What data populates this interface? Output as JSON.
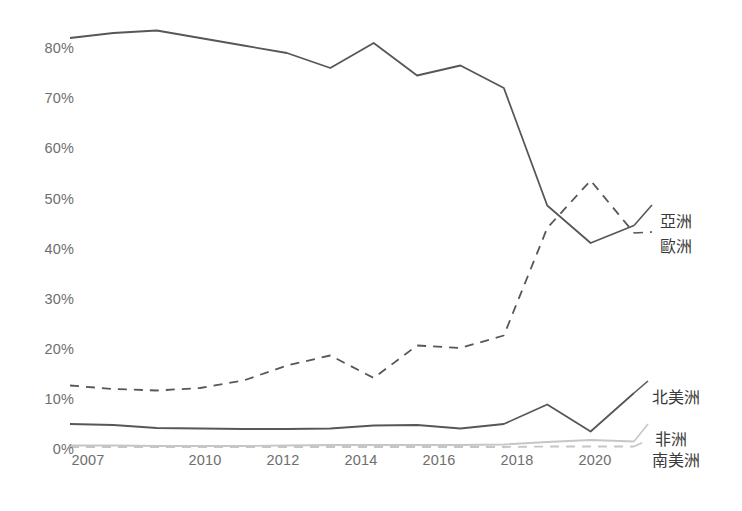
{
  "chart_data": {
    "type": "line",
    "title": "",
    "subtitle": "",
    "xlabel": "",
    "ylabel": "",
    "grid": false,
    "legend_position": "right-inline-end-of-line",
    "x": [
      2007,
      2008,
      2009,
      2010,
      2011,
      2012,
      2013,
      2014,
      2015,
      2016,
      2017,
      2018,
      2019,
      2020
    ],
    "xtick_labels": [
      "2007",
      "2010",
      "2012",
      "2014",
      "2016",
      "2018",
      "2020"
    ],
    "xtick_values": [
      2007,
      2010,
      2012,
      2014,
      2016,
      2018,
      2020
    ],
    "ytick_labels": [
      "0%",
      "10%",
      "20%",
      "30%",
      "40%",
      "50%",
      "60%",
      "70%",
      "80%"
    ],
    "ytick_values": [
      0,
      10,
      20,
      30,
      40,
      50,
      60,
      70,
      80
    ],
    "ylim": [
      0,
      86
    ],
    "xlim": [
      2007,
      2020
    ],
    "yunit": "%",
    "series": [
      {
        "name": "亞洲",
        "label": "亞洲",
        "style": "solid",
        "color": "#575757",
        "width": 1.8,
        "values": [
          82.0,
          83.0,
          83.5,
          82.0,
          80.5,
          79.0,
          76.0,
          81.0,
          74.5,
          76.5,
          72.0,
          48.5,
          41.0,
          44.5
        ]
      },
      {
        "name": "歐洲",
        "label": "歐洲",
        "style": "dashed",
        "color": "#575757",
        "width": 1.8,
        "values": [
          12.5,
          11.8,
          11.5,
          12.0,
          13.5,
          16.5,
          18.5,
          14.0,
          20.5,
          20.0,
          22.5,
          44.0,
          53.5,
          43.0
        ]
      },
      {
        "name": "北美洲",
        "label": "北美洲",
        "style": "solid",
        "color": "#575757",
        "width": 1.8,
        "values": [
          4.8,
          4.6,
          4.0,
          3.9,
          3.8,
          3.8,
          3.9,
          4.5,
          4.6,
          3.9,
          4.8,
          8.7,
          3.3,
          11.0
        ]
      },
      {
        "name": "非洲",
        "label": "非洲",
        "style": "solid",
        "color": "#c6c6c6",
        "width": 1.8,
        "values": [
          0.5,
          0.5,
          0.4,
          0.4,
          0.4,
          0.5,
          0.6,
          0.6,
          0.6,
          0.6,
          0.7,
          1.2,
          1.6,
          1.3
        ]
      },
      {
        "name": "南美洲",
        "label": "南美洲",
        "style": "dashed",
        "color": "#c6c6c6",
        "width": 1.8,
        "values": [
          0.2,
          0.2,
          0.2,
          0.2,
          0.2,
          0.2,
          0.2,
          0.2,
          0.2,
          0.2,
          0.2,
          0.3,
          0.3,
          0.3
        ]
      }
    ],
    "series_label_positions": [
      {
        "label": "亞洲",
        "x": 660,
        "y": 208
      },
      {
        "label": "歐洲",
        "x": 660,
        "y": 233
      },
      {
        "label": "北美洲",
        "x": 652,
        "y": 384
      },
      {
        "label": "非洲",
        "x": 655,
        "y": 426
      },
      {
        "label": "南美洲",
        "x": 652,
        "y": 447
      }
    ]
  },
  "axes": {
    "ytick_x": 18,
    "xtick_y": 452,
    "ytick_positions": [
      {
        "label": "0%",
        "y": 441
      },
      {
        "label": "10%",
        "y": 391
      },
      {
        "label": "20%",
        "y": 341
      },
      {
        "label": "30%",
        "y": 291
      },
      {
        "label": "40%",
        "y": 241
      },
      {
        "label": "50%",
        "y": 191
      },
      {
        "label": "60%",
        "y": 140
      },
      {
        "label": "70%",
        "y": 90
      },
      {
        "label": "80%",
        "y": 40
      }
    ],
    "xtick_positions": [
      {
        "label": "2007",
        "x": 58
      },
      {
        "label": "2010",
        "x": 175
      },
      {
        "label": "2012",
        "x": 253
      },
      {
        "label": "2014",
        "x": 331
      },
      {
        "label": "2016",
        "x": 409
      },
      {
        "label": "2018",
        "x": 487
      },
      {
        "label": "2020",
        "x": 565
      }
    ]
  }
}
